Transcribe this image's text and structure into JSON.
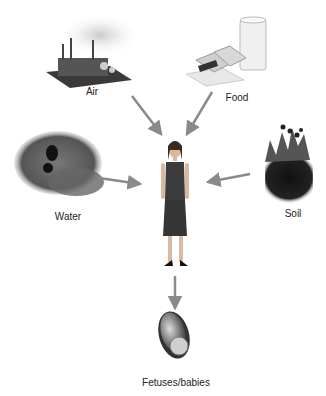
{
  "diagram": {
    "title": "",
    "center": {
      "name": "person",
      "label": ""
    },
    "sources": [
      {
        "id": "air",
        "label": "Air",
        "icon": "factory-icon"
      },
      {
        "id": "food",
        "label": "Food",
        "icon": "sandwich-milk-icon"
      },
      {
        "id": "water",
        "label": "Water",
        "icon": "drain-pipe-icon"
      },
      {
        "id": "soil",
        "label": "Soil",
        "icon": "soil-plants-icon"
      }
    ],
    "target": {
      "id": "fetus",
      "label": "Fetuses/babies",
      "icon": "fetus-icon"
    },
    "edges": [
      {
        "from": "Air",
        "to": "person"
      },
      {
        "from": "Food",
        "to": "person"
      },
      {
        "from": "Water",
        "to": "person"
      },
      {
        "from": "Soil",
        "to": "person"
      },
      {
        "from": "person",
        "to": "Fetuses/babies"
      }
    ],
    "colors": {
      "arrow": "#8a8a8a",
      "label": "#222222"
    }
  }
}
